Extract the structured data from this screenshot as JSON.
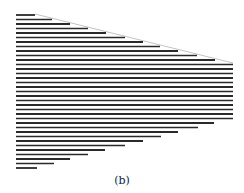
{
  "caption": "(b)",
  "colors": {
    "line": "#2a2a2a",
    "guide": "#9a9a9a",
    "background": "#ffffff"
  },
  "figure": {
    "left_x": 16,
    "guide_line": {
      "x1": 35,
      "y1": 14,
      "x2": 233,
      "y2": 63
    },
    "lines": [
      {
        "y": 15,
        "x_end": 35
      },
      {
        "y": 19.5,
        "x_end": 52
      },
      {
        "y": 24,
        "x_end": 70
      },
      {
        "y": 28.5,
        "x_end": 88
      },
      {
        "y": 33,
        "x_end": 106
      },
      {
        "y": 37.5,
        "x_end": 125
      },
      {
        "y": 42,
        "x_end": 143
      },
      {
        "y": 46.5,
        "x_end": 160
      },
      {
        "y": 51,
        "x_end": 178
      },
      {
        "y": 55.5,
        "x_end": 197
      },
      {
        "y": 60,
        "x_end": 215
      },
      {
        "y": 64.5,
        "x_end": 233
      },
      {
        "y": 69,
        "x_end": 233
      },
      {
        "y": 73.5,
        "x_end": 233
      },
      {
        "y": 78,
        "x_end": 233
      },
      {
        "y": 82.5,
        "x_end": 233
      },
      {
        "y": 87,
        "x_end": 233
      },
      {
        "y": 91.5,
        "x_end": 233
      },
      {
        "y": 96,
        "x_end": 233
      },
      {
        "y": 100.5,
        "x_end": 233
      },
      {
        "y": 105,
        "x_end": 233
      },
      {
        "y": 109.5,
        "x_end": 233
      },
      {
        "y": 114,
        "x_end": 233
      },
      {
        "y": 118.5,
        "x_end": 233
      },
      {
        "y": 123,
        "x_end": 214
      },
      {
        "y": 127.5,
        "x_end": 198
      },
      {
        "y": 132,
        "x_end": 178
      },
      {
        "y": 136.5,
        "x_end": 161
      },
      {
        "y": 141,
        "x_end": 143
      },
      {
        "y": 145.5,
        "x_end": 125
      },
      {
        "y": 150,
        "x_end": 105
      },
      {
        "y": 154.5,
        "x_end": 88
      },
      {
        "y": 159,
        "x_end": 70
      },
      {
        "y": 163.5,
        "x_end": 54
      },
      {
        "y": 168,
        "x_end": 37
      }
    ]
  }
}
